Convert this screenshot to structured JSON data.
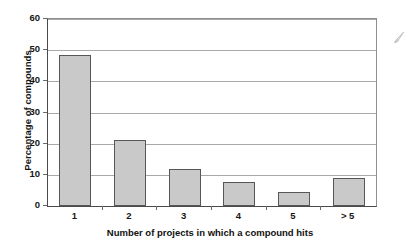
{
  "chart_data": {
    "type": "bar",
    "title": "",
    "subtitle": "",
    "xlabel": "Number of projects in which a compound hits",
    "ylabel": "Percentage of compounds",
    "categories": [
      "1",
      "2",
      "3",
      "4",
      "5",
      "> 5"
    ],
    "values": [
      48.5,
      21.3,
      12.0,
      7.7,
      4.5,
      9.0
    ],
    "ylim": [
      0,
      60
    ],
    "yticks": [
      0,
      10,
      20,
      30,
      40,
      50,
      60
    ],
    "ytick_labels": [
      "0",
      "10",
      "20",
      "30",
      "40",
      "50",
      "60"
    ],
    "grid": "horizontal",
    "legend": "none",
    "bar_fill_color": "#c9c9c9",
    "bar_edge_color": "#575757",
    "gridline_color": "#a9a9a9",
    "axis_color": "#4a4a4a",
    "background_color": "#ffffff",
    "annotations": []
  },
  "artifacts": {
    "smudge_name": "scan-smudge-mark"
  }
}
